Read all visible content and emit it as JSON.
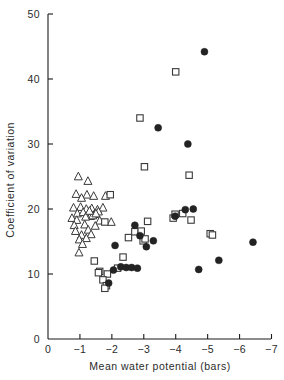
{
  "chart_data": {
    "type": "scatter",
    "title": "",
    "xlabel": "Mean water potential (bars)",
    "ylabel": "Coefficient of variation",
    "xlim": [
      0,
      -7
    ],
    "ylim": [
      0,
      50
    ],
    "xticks": [
      0,
      -1,
      -2,
      -3,
      -4,
      -5,
      -6,
      -7
    ],
    "xticklabels": [
      "0",
      "−1",
      "−2",
      "−3",
      "−4",
      "−5",
      "−6",
      "−7"
    ],
    "yticks": [
      0,
      10,
      20,
      30,
      40,
      50
    ],
    "yticklabels": [
      "0",
      "10",
      "20",
      "30",
      "40",
      "50"
    ],
    "grid": false,
    "legend": "none",
    "series": [
      {
        "name": "open-triangle",
        "marker": "triangle",
        "fill": "#ffffff",
        "edge": "#3a3a3a",
        "points": [
          [
            -0.95,
            25.0
          ],
          [
            -1.25,
            24.3
          ],
          [
            -0.88,
            22.3
          ],
          [
            -1.22,
            22.2
          ],
          [
            -1.43,
            22.0
          ],
          [
            -1.8,
            22.0
          ],
          [
            -1.05,
            21.7
          ],
          [
            -0.8,
            20.2
          ],
          [
            -1.02,
            20.3
          ],
          [
            -1.2,
            20.0
          ],
          [
            -1.37,
            20.1
          ],
          [
            -1.55,
            19.9
          ],
          [
            -1.72,
            20.2
          ],
          [
            -0.92,
            19.3
          ],
          [
            -1.1,
            19.5
          ],
          [
            -1.28,
            19.4
          ],
          [
            -1.45,
            19.2
          ],
          [
            -1.58,
            19.6
          ],
          [
            -1.33,
            18.9
          ],
          [
            -1.18,
            18.8
          ],
          [
            -1.4,
            19.0
          ],
          [
            -1.5,
            19.3
          ],
          [
            -1.3,
            19.7
          ],
          [
            -0.75,
            18.6
          ],
          [
            -0.9,
            18.3
          ],
          [
            -1.62,
            18.2
          ],
          [
            -1.98,
            18.0
          ],
          [
            -0.82,
            17.5
          ],
          [
            -1.15,
            17.6
          ],
          [
            -1.48,
            17.4
          ],
          [
            -0.86,
            16.6
          ],
          [
            -1.26,
            16.8
          ],
          [
            -1.05,
            16.0
          ],
          [
            -1.35,
            16.1
          ],
          [
            -0.98,
            15.3
          ],
          [
            -1.2,
            15.5
          ],
          [
            -1.08,
            14.6
          ],
          [
            -0.97,
            13.3
          ]
        ]
      },
      {
        "name": "open-square",
        "marker": "square",
        "fill": "#ffffff",
        "edge": "#3a3a3a",
        "points": [
          [
            -4.0,
            41.1
          ],
          [
            -2.88,
            34.0
          ],
          [
            -3.02,
            26.5
          ],
          [
            -4.42,
            25.2
          ],
          [
            -1.95,
            22.2
          ],
          [
            -3.12,
            18.1
          ],
          [
            -3.92,
            18.6
          ],
          [
            -3.98,
            19.2
          ],
          [
            -4.22,
            19.3
          ],
          [
            -4.48,
            18.3
          ],
          [
            -5.08,
            16.2
          ],
          [
            -5.15,
            16.0
          ],
          [
            -2.52,
            15.6
          ],
          [
            -2.98,
            15.1
          ],
          [
            -3.04,
            15.4
          ],
          [
            -2.72,
            16.5
          ],
          [
            -2.92,
            16.6
          ],
          [
            -1.78,
            18.0
          ],
          [
            -1.45,
            12.0
          ],
          [
            -2.35,
            12.6
          ],
          [
            -1.62,
            10.4
          ],
          [
            -1.58,
            10.2
          ],
          [
            -1.86,
            10.0
          ],
          [
            -1.72,
            9.1
          ],
          [
            -1.83,
            8.2
          ],
          [
            -1.78,
            7.8
          ],
          [
            -2.18,
            10.9
          ]
        ]
      },
      {
        "name": "filled-circle",
        "marker": "circle",
        "fill": "#232323",
        "edge": "#232323",
        "points": [
          [
            -4.9,
            44.2
          ],
          [
            -3.45,
            32.5
          ],
          [
            -4.38,
            30.0
          ],
          [
            -3.98,
            18.9
          ],
          [
            -4.3,
            19.9
          ],
          [
            -4.55,
            20.0
          ],
          [
            -2.72,
            17.5
          ],
          [
            -2.88,
            15.9
          ],
          [
            -3.08,
            14.2
          ],
          [
            -3.3,
            15.1
          ],
          [
            -2.1,
            14.4
          ],
          [
            -2.28,
            11.1
          ],
          [
            -2.45,
            11.0
          ],
          [
            -2.62,
            11.0
          ],
          [
            -2.8,
            10.9
          ],
          [
            -2.05,
            10.6
          ],
          [
            -1.9,
            8.6
          ],
          [
            -4.72,
            10.7
          ],
          [
            -5.35,
            12.1
          ],
          [
            -6.42,
            14.9
          ]
        ]
      }
    ]
  },
  "axes": {
    "x_label": "Mean water potential (bars)",
    "y_label": "Coefficient of variation"
  }
}
